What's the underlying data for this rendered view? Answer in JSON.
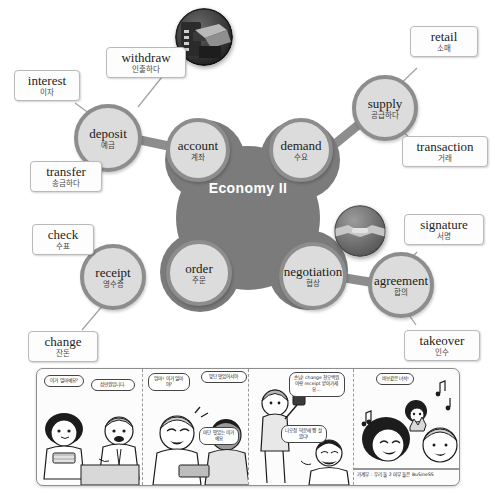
{
  "mindmap": {
    "center": {
      "title": "Economy II"
    },
    "nodes": [
      {
        "en": "deposit",
        "ko": "예금"
      },
      {
        "en": "account",
        "ko": "계좌"
      },
      {
        "en": "demand",
        "ko": "수요"
      },
      {
        "en": "supply",
        "ko": "공급하다"
      },
      {
        "en": "order",
        "ko": "주문"
      },
      {
        "en": "receipt",
        "ko": "영수증"
      },
      {
        "en": "negotiation",
        "ko": "협상"
      },
      {
        "en": "agreement",
        "ko": "합의"
      }
    ],
    "labels": [
      {
        "en": "interest",
        "ko": "이자"
      },
      {
        "en": "withdraw",
        "ko": "인출하다"
      },
      {
        "en": "transfer",
        "ko": "송금하다"
      },
      {
        "en": "retail",
        "ko": "소매"
      },
      {
        "en": "transaction",
        "ko": "거래"
      },
      {
        "en": "check",
        "ko": "수표"
      },
      {
        "en": "change",
        "ko": "잔돈"
      },
      {
        "en": "signature",
        "ko": "서명"
      },
      {
        "en": "takeover",
        "ko": "인수"
      }
    ],
    "photos": [
      {
        "name": "atm-photo"
      },
      {
        "name": "handshake-photo"
      }
    ],
    "colors": {
      "node_fill": "#dcdcdc",
      "node_stroke": "#8d8d8d",
      "center_fill": "#7b7b7b",
      "connector": "#9a9a9a",
      "label_border": "#b9b9b9"
    }
  },
  "comic": {
    "panels": [
      {
        "id": "panel-1",
        "bubbles": [
          {
            "text": "이거\n얼마예요?"
          },
          {
            "text": "삼만원입니다."
          }
        ],
        "caption": ""
      },
      {
        "id": "panel-2",
        "bubbles": [
          {
            "text": "엄마! 이거\n얼마야?"
          },
          {
            "text": "맞단 맛있어서야"
          },
          {
            "text": "마단 맛있는\n이거예요"
          }
        ],
        "caption": ""
      },
      {
        "id": "panel-3",
        "bubbles": [
          {
            "text": "손님! change\n천오백원이랑\nreceipt\n받아가세요..."
          },
          {
            "text": "나오정 덕분에\n쨍 살았다!"
          }
        ],
        "caption": ""
      },
      {
        "id": "panel-4",
        "bubbles": [
          {
            "text": "바보같은\n녀석!"
          }
        ],
        "caption": "가계부 : 우리 둘 2 마무 둘은 BuSineSS"
      }
    ]
  }
}
